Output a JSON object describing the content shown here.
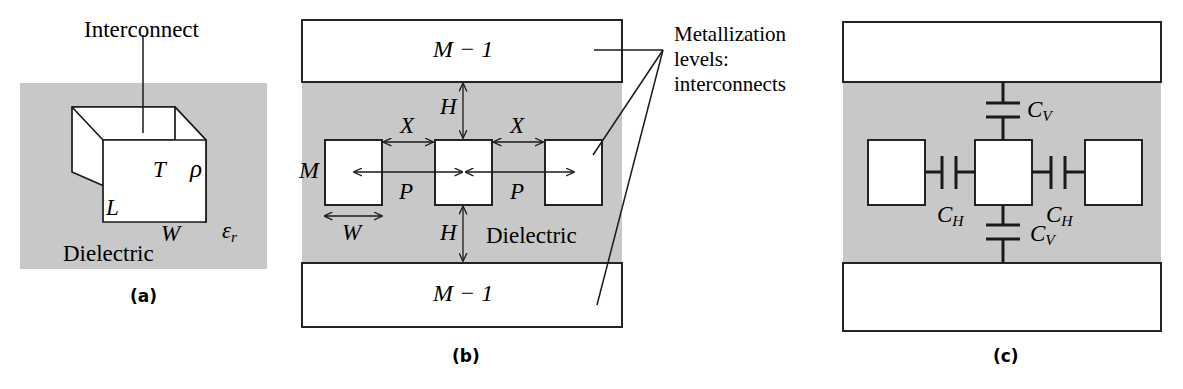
{
  "figure": {
    "type": "technical-diagram",
    "fill_gray": "#c8c8c8",
    "stroke": "#1a1a1a",
    "background": "#ffffff"
  },
  "annotation": {
    "text": "Metallization\nlevels:\ninterconnects"
  },
  "panel_a": {
    "caption": "(a)",
    "callout": "Interconnect",
    "dielectric_label": "Dielectric",
    "permittivity_label": "ε",
    "permittivity_sub": "r",
    "dim_thickness": "T",
    "dim_resistivity": "ρ",
    "dim_length": "L",
    "dim_width": "W"
  },
  "panel_b": {
    "caption": "(b)",
    "top_level": "M − 1",
    "bottom_level": "M − 1",
    "current_level": "M",
    "dielectric_label": "Dielectric",
    "dim_height_top": "H",
    "dim_height_bottom": "H",
    "dim_spacing_left": "X",
    "dim_spacing_right": "X",
    "dim_pitch_left": "P",
    "dim_pitch_right": "P",
    "dim_width": "W"
  },
  "panel_c": {
    "caption": "(c)",
    "cap_vertical_top": "C",
    "cap_vertical_top_sub": "V",
    "cap_vertical_bottom": "C",
    "cap_vertical_bottom_sub": "V",
    "cap_horizontal_left": "C",
    "cap_horizontal_left_sub": "H",
    "cap_horizontal_right": "C",
    "cap_horizontal_right_sub": "H"
  }
}
